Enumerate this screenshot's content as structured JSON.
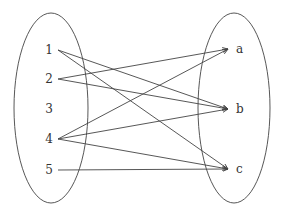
{
  "diagram": {
    "type": "mapping",
    "colors": {
      "stroke": "#444444",
      "text": "#333333",
      "background": "#ffffff"
    },
    "domain_set": {
      "ellipse": {
        "cx": 51,
        "cy": 108,
        "rx": 37,
        "ry": 95
      },
      "elements": [
        {
          "id": "1",
          "label": "1",
          "x": 49,
          "y": 50
        },
        {
          "id": "2",
          "label": "2",
          "x": 49,
          "y": 79
        },
        {
          "id": "3",
          "label": "3",
          "x": 49,
          "y": 109
        },
        {
          "id": "4",
          "label": "4",
          "x": 49,
          "y": 139
        },
        {
          "id": "5",
          "label": "5",
          "x": 49,
          "y": 170
        }
      ]
    },
    "codomain_set": {
      "ellipse": {
        "cx": 234,
        "cy": 108,
        "rx": 36,
        "ry": 95
      },
      "elements": [
        {
          "id": "a",
          "label": "a",
          "x": 236,
          "y": 49
        },
        {
          "id": "b",
          "label": "b",
          "x": 236,
          "y": 109
        },
        {
          "id": "c",
          "label": "c",
          "x": 236,
          "y": 169
        }
      ]
    },
    "edges": [
      {
        "from": "1",
        "to": "b"
      },
      {
        "from": "1",
        "to": "c"
      },
      {
        "from": "2",
        "to": "a"
      },
      {
        "from": "2",
        "to": "b"
      },
      {
        "from": "4",
        "to": "a"
      },
      {
        "from": "4",
        "to": "b"
      },
      {
        "from": "4",
        "to": "c"
      },
      {
        "from": "5",
        "to": "c"
      }
    ]
  }
}
